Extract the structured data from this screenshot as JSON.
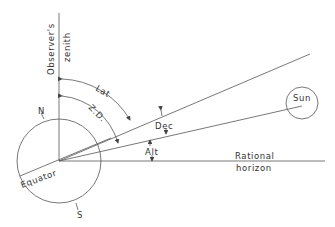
{
  "diagram": {
    "labels": {
      "zenith_line1": "Observer's",
      "zenith_line2": "zenith",
      "lat": "Lat",
      "zd": "Z.D.",
      "north": "N",
      "south": "S",
      "equator": "Equator",
      "sun": "Sun",
      "dec": "Dec",
      "alt": "Alt",
      "horizon_line1": "Rational",
      "horizon_line2": "horizon"
    },
    "colors": {
      "line": "#555555",
      "text": "#333333",
      "background": "#ffffff"
    }
  }
}
